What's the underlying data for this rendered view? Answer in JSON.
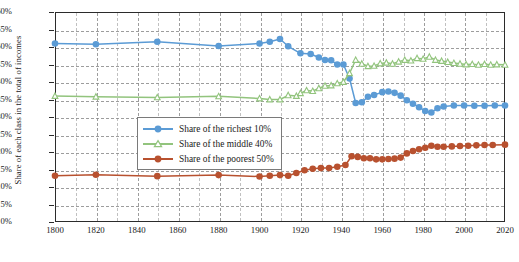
{
  "chart_data": {
    "type": "line",
    "title": "",
    "xlabel": "",
    "ylabel": "Share of each class in the total of incomes",
    "xlim": [
      1800,
      2020
    ],
    "ylim": [
      0,
      60
    ],
    "ytick_labels": [
      "0%",
      "5%",
      "10%",
      "15%",
      "20%",
      "25%",
      "30%",
      "35%",
      "40%",
      "45%",
      "50%",
      "55%",
      "60%"
    ],
    "ytick_values": [
      0,
      5,
      10,
      15,
      20,
      25,
      30,
      35,
      40,
      45,
      50,
      55,
      60
    ],
    "xtick_labels": [
      "1800",
      "1820",
      "1840",
      "1860",
      "1880",
      "1900",
      "1920",
      "1940",
      "1960",
      "1980",
      "2000",
      "2020"
    ],
    "xtick_values": [
      1800,
      1820,
      1840,
      1860,
      1880,
      1900,
      1920,
      1940,
      1960,
      1980,
      2000,
      2020
    ],
    "grid": true,
    "legend_position": "center-left",
    "series": [
      {
        "name": "Share of the richest 10%",
        "color": "#5b9bd5",
        "marker": "circle-filled",
        "x": [
          1800,
          1820,
          1850,
          1880,
          1900,
          1905,
          1910,
          1914,
          1920,
          1925,
          1929,
          1932,
          1935,
          1938,
          1941,
          1944,
          1947,
          1950,
          1953,
          1956,
          1960,
          1963,
          1966,
          1969,
          1972,
          1975,
          1978,
          1981,
          1984,
          1987,
          1990,
          1995,
          2000,
          2005,
          2010,
          2015,
          2020
        ],
        "values": [
          51.0,
          50.8,
          51.5,
          50.3,
          51.0,
          51.5,
          52.3,
          50.2,
          48.2,
          48.0,
          47.0,
          46.3,
          46.2,
          45.0,
          45.0,
          41.0,
          34.0,
          34.2,
          35.8,
          36.3,
          37.1,
          37.3,
          36.9,
          36.1,
          34.8,
          33.8,
          32.8,
          31.7,
          31.3,
          32.5,
          33.0,
          33.3,
          33.3,
          33.2,
          33.2,
          33.3,
          33.3
        ]
      },
      {
        "name": "Share of the middle 40%",
        "color": "#92c47d",
        "marker": "triangle-open",
        "x": [
          1800,
          1820,
          1850,
          1880,
          1900,
          1905,
          1910,
          1914,
          1918,
          1920,
          1923,
          1926,
          1929,
          1932,
          1935,
          1938,
          1941,
          1944,
          1947,
          1950,
          1953,
          1956,
          1959,
          1962,
          1965,
          1968,
          1971,
          1974,
          1977,
          1980,
          1983,
          1986,
          1989,
          1992,
          1995,
          1998,
          2001,
          2004,
          2007,
          2010,
          2013,
          2016,
          2020
        ],
        "values": [
          36.0,
          35.8,
          35.6,
          35.9,
          35.3,
          35.0,
          35.0,
          36.2,
          36.0,
          36.8,
          37.6,
          37.4,
          38.2,
          38.9,
          39.0,
          39.6,
          40.0,
          42.5,
          46.3,
          45.2,
          44.5,
          44.6,
          45.3,
          45.5,
          45.2,
          45.8,
          46.3,
          46.1,
          46.8,
          46.6,
          47.2,
          46.3,
          46.0,
          45.7,
          45.4,
          45.2,
          45.0,
          45.1,
          44.9,
          45.1,
          44.9,
          45.0,
          44.9
        ]
      },
      {
        "name": "Share of the poorest 50%",
        "color": "#b8512f",
        "marker": "circle-filled",
        "x": [
          1800,
          1820,
          1850,
          1880,
          1900,
          1905,
          1910,
          1914,
          1918,
          1922,
          1926,
          1930,
          1934,
          1938,
          1942,
          1945,
          1948,
          1951,
          1954,
          1957,
          1960,
          1963,
          1966,
          1969,
          1972,
          1975,
          1978,
          1981,
          1984,
          1987,
          1990,
          1994,
          1998,
          2002,
          2006,
          2010,
          2014,
          2020
        ],
        "values": [
          13.2,
          13.5,
          13.1,
          13.4,
          13.0,
          13.2,
          13.4,
          13.2,
          14.0,
          14.8,
          15.2,
          15.4,
          15.4,
          15.8,
          16.3,
          18.8,
          18.6,
          18.2,
          18.2,
          17.9,
          17.9,
          18.0,
          18.1,
          18.4,
          19.6,
          20.3,
          20.8,
          21.2,
          21.8,
          21.5,
          21.5,
          21.6,
          21.7,
          21.8,
          21.9,
          22.0,
          22.0,
          22.1
        ]
      }
    ]
  },
  "legend": {
    "items": [
      {
        "label": "Share of the richest 10%"
      },
      {
        "label": "Share of the middle 40%"
      },
      {
        "label": "Share of the poorest 50%"
      }
    ]
  }
}
